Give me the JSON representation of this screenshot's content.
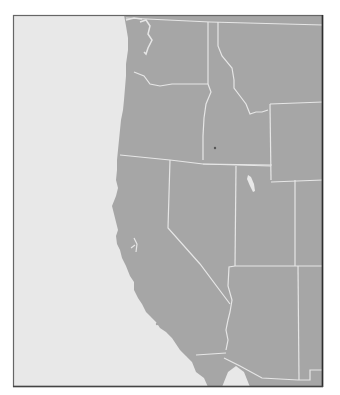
{
  "map": {
    "title": "Western United States",
    "style": "grayscale outline map",
    "colors": {
      "background": "#ffffff",
      "ocean": "#e8e8e8",
      "land": "#a6a6a6",
      "borders": "#e6e6e6",
      "frame": "#555555",
      "frame_right": "#333333"
    },
    "frame": {
      "x": 13,
      "y": 15,
      "width": 310,
      "height": 372
    },
    "regions": [
      {
        "id": "washington",
        "label": "Washington"
      },
      {
        "id": "oregon",
        "label": "Oregon"
      },
      {
        "id": "california",
        "label": "California"
      },
      {
        "id": "idaho",
        "label": "Idaho"
      },
      {
        "id": "montana",
        "label": "Montana"
      },
      {
        "id": "wyoming",
        "label": "Wyoming"
      },
      {
        "id": "nevada",
        "label": "Nevada"
      },
      {
        "id": "utah",
        "label": "Utah"
      },
      {
        "id": "arizona",
        "label": "Arizona"
      },
      {
        "id": "colorado",
        "label": "Colorado"
      },
      {
        "id": "new-mexico",
        "label": "New Mexico"
      },
      {
        "id": "baja-california",
        "label": "Baja California"
      },
      {
        "id": "sonora",
        "label": "Sonora"
      }
    ],
    "water_features": [
      {
        "id": "puget-sound",
        "label": "Puget Sound"
      },
      {
        "id": "great-salt-lake",
        "label": "Great Salt Lake"
      },
      {
        "id": "san-francisco-bay",
        "label": "San Francisco Bay"
      },
      {
        "id": "pacific-ocean",
        "label": "Pacific Ocean"
      }
    ]
  }
}
